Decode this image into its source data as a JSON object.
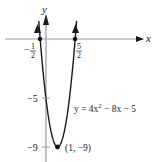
{
  "chart_data": {
    "type": "line",
    "title": "",
    "equation": "y = 4x² − 8x − 5",
    "equation_parts": {
      "pre": "y = 4x",
      "sup": "2",
      "post": " − 8x − 5"
    },
    "xlabel": "x",
    "ylabel": "y",
    "x_ticks": [
      {
        "value": -0.5,
        "num": "1",
        "den": "2",
        "sign": "−"
      },
      {
        "value": 2.5,
        "num": "5",
        "den": "2",
        "sign": ""
      }
    ],
    "y_ticks": [
      {
        "value": -5,
        "label": "−5"
      },
      {
        "value": -9,
        "label": "−9"
      }
    ],
    "points": [
      {
        "x": -0.5,
        "y": 0,
        "label": ""
      },
      {
        "x": 2.5,
        "y": 0,
        "label": ""
      },
      {
        "x": 1,
        "y": -9,
        "label": "(1, −9)"
      }
    ],
    "vertex_label": "(1, −9)",
    "series": [
      {
        "name": "y = 4x^2 - 8x - 5",
        "x": [
          -0.75,
          -0.5,
          0,
          0.5,
          1,
          1.5,
          2,
          2.5,
          2.75
        ],
        "values": [
          2.25,
          0,
          -5,
          -8,
          -9,
          -8,
          -5,
          0,
          2.25
        ]
      }
    ],
    "xlim": [
      -4,
      8
    ],
    "ylim": [
      -10,
      2.5
    ],
    "grid": false,
    "colors": {
      "curve": "#1a1a1a",
      "axis": "#9a9a9a",
      "point": "#111111"
    }
  }
}
